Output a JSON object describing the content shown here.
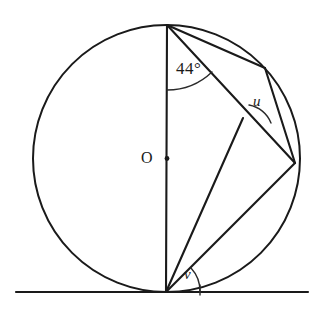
{
  "figure": {
    "type": "geometry-diagram",
    "background_color": "#ffffff",
    "ink_color": "#1a1a1a"
  },
  "labels": {
    "center": "O",
    "angle_top": "44°",
    "angle_u": "u",
    "angle_v": "v"
  },
  "geometry": {
    "circle": {
      "center_x": 166.5,
      "center_y": 158.5,
      "radius": 133.5,
      "label": "O"
    },
    "points": {
      "top": {
        "x": 167,
        "y": 25,
        "name": "T"
      },
      "bottom_tangency": {
        "x": 166,
        "y": 292,
        "name": "B"
      },
      "center": {
        "x": 166.5,
        "y": 158.5,
        "name": "O"
      },
      "upper_right": {
        "x": 265,
        "y": 68,
        "name": "P"
      },
      "right": {
        "x": 295,
        "y": 163,
        "name": "R"
      },
      "crossing_u": {
        "x": 243,
        "y": 118,
        "name": "Q"
      }
    },
    "tangent_line": {
      "x1": 16,
      "y1": 292,
      "x2": 308,
      "y2": 292
    },
    "segments": [
      {
        "name": "vertical-diameter",
        "from": "top",
        "to": "bottom_tangency"
      },
      {
        "name": "chord-top-to-right",
        "from": "top",
        "to": "right"
      },
      {
        "name": "chord-top-to-upper-right",
        "from": "top",
        "to": "upper_right"
      },
      {
        "name": "chord-upper-right-to-right",
        "from": "upper_right",
        "to": "right"
      },
      {
        "name": "line-bottom-to-crossing",
        "from": "bottom_tangency",
        "to": "crossing_u"
      },
      {
        "name": "line-bottom-to-right",
        "from": "bottom_tangency",
        "to": "right"
      }
    ],
    "angle_arcs": [
      {
        "name": "arc-44-degrees",
        "vertex": "top",
        "value": "44°"
      },
      {
        "name": "arc-u",
        "vertex": "crossing_u",
        "value": "u"
      },
      {
        "name": "arc-v",
        "vertex": "bottom_tangency",
        "value": "v"
      }
    ]
  }
}
